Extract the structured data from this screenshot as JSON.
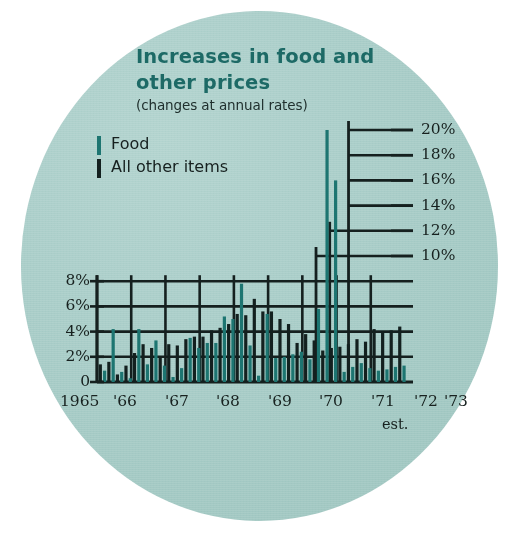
{
  "figure": {
    "title_line1": "Increases in food and",
    "title_line2": "other prices",
    "subtitle": "(changes at annual rates)",
    "est_note": "est.",
    "background_color": "#a8cdc8",
    "title_color": "#1d6a66",
    "food_color": "#1d7571",
    "other_color": "#13201f"
  },
  "legend": {
    "position": "upper-left",
    "items": [
      {
        "label": "Food",
        "color": "#1d7571",
        "swatch": "bar-swatch-teal"
      },
      {
        "label": "All other items",
        "color": "#13201f",
        "swatch": "bar-swatch-dark"
      }
    ]
  },
  "axes": {
    "left_ticks": [
      "8%",
      "6%",
      "4%",
      "2%",
      "0"
    ],
    "left_values": [
      8,
      6,
      4,
      2,
      0
    ],
    "right_ticks": [
      "20%",
      "18%",
      "16%",
      "14%",
      "12%",
      "10%"
    ],
    "right_values": [
      20,
      18,
      16,
      14,
      12,
      10
    ],
    "year_labels": [
      "1965",
      "'66",
      "'67",
      "'68",
      "'69",
      "'70",
      "'71",
      "'72",
      "'73"
    ]
  },
  "chart_data": {
    "type": "bar",
    "title": "Increases in food and other prices",
    "subtitle": "(changes at annual rates)",
    "xlabel": "",
    "ylabel": "percent change at annual rate",
    "ylim": [
      0,
      21
    ],
    "grid": true,
    "legend_position": "upper-left",
    "note": "Quarterly observations, 4 per year, 1965 through 1973 (1973 estimated).",
    "categories": [
      "1965 Q1",
      "1965 Q2",
      "1965 Q3",
      "1965 Q4",
      "'66 Q1",
      "'66 Q2",
      "'66 Q3",
      "'66 Q4",
      "'67 Q1",
      "'67 Q2",
      "'67 Q3",
      "'67 Q4",
      "'68 Q1",
      "'68 Q2",
      "'68 Q3",
      "'68 Q4",
      "'69 Q1",
      "'69 Q2",
      "'69 Q3",
      "'69 Q4",
      "'70 Q1",
      "'70 Q2",
      "'70 Q3",
      "'70 Q4",
      "'71 Q1",
      "'71 Q2",
      "'71 Q3",
      "'71 Q4",
      "'72 Q1",
      "'72 Q2",
      "'72 Q3",
      "'72 Q4",
      "'73 Q1",
      "'73 Q2",
      "'73 Q3",
      "'73 Q4"
    ],
    "series": [
      {
        "name": "All other items",
        "color": "#13201f",
        "values": [
          1.4,
          1.6,
          0.6,
          1.3,
          2.3,
          3.0,
          2.7,
          2.0,
          3.0,
          2.9,
          3.4,
          3.6,
          3.6,
          4.1,
          4.3,
          4.6,
          5.4,
          5.3,
          6.6,
          5.6,
          5.6,
          5.0,
          4.6,
          3.1,
          3.8,
          3.3,
          2.5,
          2.7,
          2.8,
          3.0,
          3.4,
          3.2,
          4.2,
          4.0,
          4.1,
          4.4
        ]
      },
      {
        "name": "Food",
        "color": "#1d7571",
        "values": [
          0.9,
          4.2,
          0.8,
          0.3,
          4.2,
          1.4,
          3.3,
          1.3,
          0.4,
          1.1,
          3.5,
          2.7,
          3.1,
          3.1,
          5.2,
          5.0,
          7.8,
          2.9,
          0.5,
          5.4,
          1.9,
          2.0,
          2.2,
          2.4,
          1.8,
          5.8,
          20.0,
          16.0,
          0.8,
          1.2,
          1.5,
          1.1,
          0.9,
          1.0,
          1.2,
          1.3
        ]
      }
    ]
  }
}
